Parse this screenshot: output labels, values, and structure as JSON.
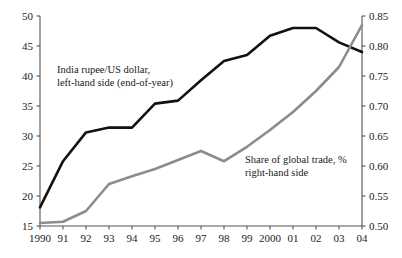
{
  "chart_data": {
    "type": "line",
    "title": "",
    "subtitle": "",
    "xlabel": "",
    "ylabel": "",
    "grid": false,
    "legend_position": "inline-annotations",
    "x": [
      "1990",
      "91",
      "92",
      "93",
      "94",
      "95",
      "96",
      "97",
      "98",
      "99",
      "2000",
      "01",
      "02",
      "03",
      "04"
    ],
    "x_tick_labels": [
      "1990",
      "91",
      "92",
      "93",
      "94",
      "95",
      "96",
      "97",
      "98",
      "99",
      "2000",
      "01",
      "02",
      "03",
      "04"
    ],
    "left_axis": {
      "ylim": [
        15,
        50
      ],
      "ticks": [
        15,
        20,
        25,
        30,
        35,
        40,
        45,
        50
      ],
      "tick_labels": [
        "15",
        "20",
        "25",
        "30",
        "35",
        "40",
        "45",
        "50"
      ]
    },
    "right_axis": {
      "ylim": [
        0.5,
        0.85
      ],
      "ticks": [
        0.5,
        0.55,
        0.6,
        0.65,
        0.7,
        0.75,
        0.8,
        0.85
      ],
      "tick_labels": [
        "0.50",
        "0.55",
        "0.60",
        "0.65",
        "0.70",
        "0.75",
        "0.80",
        "0.85"
      ]
    },
    "series": [
      {
        "name": "India rupee/US dollar, left-hand side (end-of-year)",
        "axis": "left",
        "color": "#111111",
        "width": 2.6,
        "values": [
          18.1,
          25.8,
          30.6,
          31.4,
          31.4,
          35.4,
          35.9,
          39.3,
          42.5,
          43.5,
          46.7,
          48.0,
          48.0,
          45.6,
          44.0
        ]
      },
      {
        "name": "Share of global trade, % right-hand side",
        "axis": "right",
        "color": "#8c8c8c",
        "width": 2.6,
        "values": [
          0.505,
          0.507,
          0.525,
          0.57,
          0.583,
          0.595,
          0.61,
          0.625,
          0.608,
          0.632,
          0.66,
          0.69,
          0.725,
          0.765,
          0.835
        ]
      }
    ],
    "annotations": [
      {
        "name": "rupee-series-annotation",
        "lines": [
          "India rupee/US dollar,",
          "left-hand side (end-of-year)"
        ],
        "x_px": 57,
        "y_px": 73
      },
      {
        "name": "trade-share-annotation",
        "lines": [
          "Share of global trade, %",
          "right-hand side"
        ],
        "x_px": 245,
        "y_px": 163
      }
    ],
    "colors": {
      "rupee_line": "#111111",
      "trade_line": "#8c8c8c",
      "axis": "#555555",
      "text": "#1a1a1a",
      "background": "#ffffff"
    }
  }
}
